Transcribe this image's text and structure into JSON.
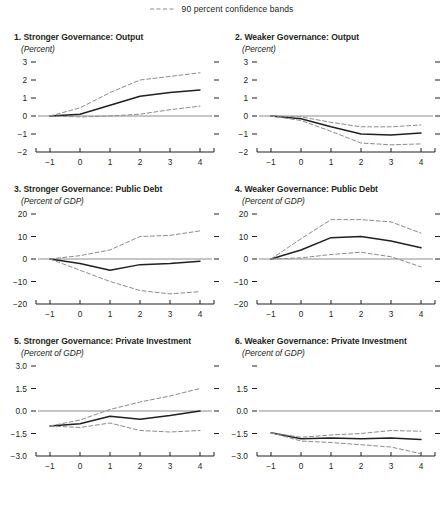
{
  "legend": {
    "label": "90 percent confidence bands",
    "line_style": "dashed",
    "line_color": "#8c8c8c"
  },
  "colors": {
    "central_line": "#231f20",
    "band_line": "#8c8c8c",
    "axis": "#231f20",
    "zero_line": "#8c8c8c",
    "text": "#231f20",
    "background": "#ffffff"
  },
  "chart_data": [
    {
      "type": "line",
      "panel": 1,
      "title": "1. Stronger Governance: Output",
      "subtitle": "(Percent)",
      "xlabel": "",
      "ylabel": "",
      "x": [
        -1,
        0,
        1,
        2,
        3,
        4
      ],
      "xtick_labels": [
        "−1",
        "0",
        "1",
        "2",
        "3",
        "4"
      ],
      "xlim": [
        -1.4,
        4.4
      ],
      "ylim": [
        -2,
        3
      ],
      "ytick_values": [
        3,
        2,
        1,
        0,
        -1,
        -2
      ],
      "ytick_labels": [
        "3",
        "2",
        "1",
        "0",
        "−1",
        "−2"
      ],
      "grid": false,
      "zero_line": true,
      "series": [
        {
          "name": "Central estimate",
          "style": "solid",
          "values": [
            0.0,
            0.1,
            0.6,
            1.1,
            1.3,
            1.45
          ]
        },
        {
          "name": "Upper 90 percent confidence band",
          "style": "dashed",
          "values": [
            0.0,
            0.45,
            1.3,
            2.0,
            2.2,
            2.4
          ]
        },
        {
          "name": "Lower 90 percent confidence band",
          "style": "dashed",
          "values": [
            0.0,
            -0.05,
            0.0,
            0.1,
            0.35,
            0.55
          ]
        }
      ]
    },
    {
      "type": "line",
      "panel": 2,
      "title": "2. Weaker Governance: Output",
      "subtitle": "(Percent)",
      "xlabel": "",
      "ylabel": "",
      "x": [
        -1,
        0,
        1,
        2,
        3,
        4
      ],
      "xtick_labels": [
        "−1",
        "0",
        "1",
        "2",
        "3",
        "4"
      ],
      "xlim": [
        -1.4,
        4.4
      ],
      "ylim": [
        -2,
        3
      ],
      "ytick_values": [
        3,
        2,
        1,
        0,
        -1,
        -2
      ],
      "ytick_labels": [
        "3",
        "2",
        "1",
        "0",
        "−1",
        "−2"
      ],
      "grid": false,
      "zero_line": true,
      "series": [
        {
          "name": "Central estimate",
          "style": "solid",
          "values": [
            0.0,
            -0.15,
            -0.6,
            -1.0,
            -1.05,
            -0.95
          ]
        },
        {
          "name": "Upper 90 percent confidence band",
          "style": "dashed",
          "values": [
            0.0,
            -0.05,
            -0.35,
            -0.6,
            -0.6,
            -0.5
          ]
        },
        {
          "name": "Lower 90 percent confidence band",
          "style": "dashed",
          "values": [
            0.0,
            -0.25,
            -0.85,
            -1.5,
            -1.6,
            -1.55
          ]
        }
      ]
    },
    {
      "type": "line",
      "panel": 3,
      "title": "3. Stronger Governance: Public Debt",
      "subtitle": "(Percent of GDP)",
      "xlabel": "",
      "ylabel": "",
      "x": [
        -1,
        0,
        1,
        2,
        3,
        4
      ],
      "xtick_labels": [
        "−1",
        "0",
        "1",
        "2",
        "3",
        "4"
      ],
      "xlim": [
        -1.4,
        4.4
      ],
      "ylim": [
        -20,
        20
      ],
      "ytick_values": [
        20,
        10,
        0,
        -10,
        -20
      ],
      "ytick_labels": [
        "20",
        "10",
        "0",
        "−10",
        "−20"
      ],
      "grid": false,
      "zero_line": true,
      "series": [
        {
          "name": "Central estimate",
          "style": "solid",
          "values": [
            0.0,
            -2.0,
            -5.0,
            -2.5,
            -2.0,
            -1.0
          ]
        },
        {
          "name": "Upper 90 percent confidence band",
          "style": "dashed",
          "values": [
            0.0,
            1.5,
            4.0,
            10.0,
            10.5,
            12.5
          ]
        },
        {
          "name": "Lower 90 percent confidence band",
          "style": "dashed",
          "values": [
            0.0,
            -5.0,
            -10.0,
            -14.0,
            -15.5,
            -14.5
          ]
        }
      ]
    },
    {
      "type": "line",
      "panel": 4,
      "title": "4. Weaker Governance: Public Debt",
      "subtitle": "(Percent of GDP)",
      "xlabel": "",
      "ylabel": "",
      "x": [
        -1,
        0,
        1,
        2,
        3,
        4
      ],
      "xtick_labels": [
        "−1",
        "0",
        "1",
        "2",
        "3",
        "4"
      ],
      "xlim": [
        -1.4,
        4.4
      ],
      "ylim": [
        -20,
        20
      ],
      "ytick_values": [
        20,
        10,
        0,
        -10,
        -20
      ],
      "ytick_labels": [
        "20",
        "10",
        "0",
        "−10",
        "−20"
      ],
      "grid": false,
      "zero_line": true,
      "series": [
        {
          "name": "Central estimate",
          "style": "solid",
          "values": [
            0.0,
            4.0,
            9.5,
            10.0,
            8.0,
            5.0
          ]
        },
        {
          "name": "Upper 90 percent confidence band",
          "style": "dashed",
          "values": [
            0.0,
            9.0,
            17.5,
            17.5,
            16.5,
            11.5
          ]
        },
        {
          "name": "Lower 90 percent confidence band",
          "style": "dashed",
          "values": [
            0.0,
            0.5,
            2.0,
            3.0,
            1.0,
            -3.5
          ]
        }
      ]
    },
    {
      "type": "line",
      "panel": 5,
      "title": "5. Stronger Governance: Private Investment",
      "subtitle": "(Percent of GDP)",
      "xlabel": "",
      "ylabel": "",
      "x": [
        -1,
        0,
        1,
        2,
        3,
        4
      ],
      "xtick_labels": [
        "−1",
        "0",
        "1",
        "2",
        "3",
        "4"
      ],
      "xlim": [
        -1.4,
        4.4
      ],
      "ylim": [
        -3.0,
        3.0
      ],
      "ytick_values": [
        3.0,
        1.5,
        0.0,
        -1.5,
        -3.0
      ],
      "ytick_labels": [
        "3.0",
        "1.5",
        "0.0",
        "−1.5",
        "−3.0"
      ],
      "grid": false,
      "zero_line": true,
      "series": [
        {
          "name": "Central estimate",
          "style": "solid",
          "values": [
            -1.0,
            -0.85,
            -0.35,
            -0.55,
            -0.3,
            0.0
          ]
        },
        {
          "name": "Upper 90 percent confidence band",
          "style": "dashed",
          "values": [
            -1.0,
            -0.6,
            0.1,
            0.6,
            1.0,
            1.5
          ]
        },
        {
          "name": "Lower 90 percent confidence band",
          "style": "dashed",
          "values": [
            -1.0,
            -1.1,
            -0.8,
            -1.3,
            -1.4,
            -1.3
          ]
        }
      ]
    },
    {
      "type": "line",
      "panel": 6,
      "title": "6. Weaker Governance: Private Investment",
      "subtitle": "(Percent of GDP)",
      "xlabel": "",
      "ylabel": "",
      "x": [
        -1,
        0,
        1,
        2,
        3,
        4
      ],
      "xtick_labels": [
        "−1",
        "0",
        "1",
        "2",
        "3",
        "4"
      ],
      "xlim": [
        -1.4,
        4.4
      ],
      "ylim": [
        -3.0,
        3.0
      ],
      "ytick_values": [
        3.0,
        1.5,
        0.0,
        -1.5,
        -3.0
      ],
      "ytick_labels": [
        "",
        "1.5",
        "0.0",
        "−1.5",
        "−3.0"
      ],
      "grid": false,
      "zero_line": true,
      "series": [
        {
          "name": "Central estimate",
          "style": "solid",
          "values": [
            -1.45,
            -1.85,
            -1.8,
            -1.85,
            -1.8,
            -1.9
          ]
        },
        {
          "name": "Upper 90 percent confidence band",
          "style": "dashed",
          "values": [
            -1.45,
            -1.75,
            -1.6,
            -1.5,
            -1.3,
            -1.35
          ]
        },
        {
          "name": "Lower 90 percent confidence band",
          "style": "dashed",
          "values": [
            -1.45,
            -2.0,
            -2.1,
            -2.25,
            -2.4,
            -2.85
          ]
        }
      ]
    }
  ]
}
